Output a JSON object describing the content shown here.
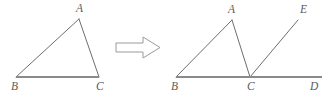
{
  "figure": {
    "stroke_color_thin": "#6e6e6e",
    "stroke_color_base": "#8a8a8a",
    "label_color": "#5b5b5b",
    "background": "#ffffff",
    "width": 332,
    "height": 96
  },
  "left_figure": {
    "name": "triangle-abc",
    "points": {
      "A": {
        "label": "A",
        "x": 79,
        "y": 19,
        "label_x": 76,
        "label_y": 12
      },
      "B": {
        "label": "B",
        "x": 16,
        "y": 77,
        "label_x": 11,
        "label_y": 90
      },
      "C": {
        "label": "C",
        "x": 99,
        "y": 77,
        "label_x": 96,
        "label_y": 90
      }
    },
    "segments": [
      {
        "name": "segment-BA",
        "from": "B",
        "to": "A",
        "style": "thin"
      },
      {
        "name": "segment-AC",
        "from": "A",
        "to": "C",
        "style": "thin"
      },
      {
        "name": "segment-BC",
        "from": "B",
        "to": "C",
        "style": "base"
      }
    ]
  },
  "arrow": {
    "name": "transform-arrow",
    "direction": "right",
    "x": 116,
    "y": 37,
    "width": 44,
    "height": 21
  },
  "right_figure": {
    "name": "triangle-abc-with-ray",
    "points": {
      "A": {
        "label": "A",
        "x": 232,
        "y": 20,
        "label_x": 228,
        "label_y": 13
      },
      "B": {
        "label": "B",
        "x": 176,
        "y": 77,
        "label_x": 171,
        "label_y": 90
      },
      "C": {
        "label": "C",
        "x": 250,
        "y": 77,
        "label_x": 247,
        "label_y": 90
      },
      "D": {
        "label": "D",
        "x": 322,
        "y": 77,
        "label_x": 310,
        "label_y": 90
      },
      "E": {
        "label": "E",
        "x": 298,
        "y": 20,
        "label_x": 300,
        "label_y": 13
      }
    },
    "segments": [
      {
        "name": "segment-BA",
        "from": "B",
        "to": "A",
        "style": "thin"
      },
      {
        "name": "segment-AC",
        "from": "A",
        "to": "C",
        "style": "thin"
      },
      {
        "name": "segment-CE",
        "from": "C",
        "to": "E",
        "style": "thin"
      },
      {
        "name": "segment-BD",
        "from": "B",
        "to": "D",
        "style": "base"
      }
    ]
  }
}
